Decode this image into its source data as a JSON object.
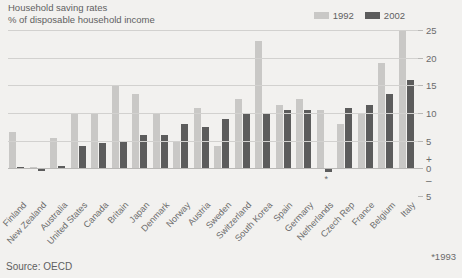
{
  "header": {
    "title": "Household saving rates",
    "subtitle": "% of disposable household income"
  },
  "legend": [
    {
      "label": "1992",
      "color": "#c9c8c6"
    },
    {
      "label": "2002",
      "color": "#5c5c5c"
    }
  ],
  "source": "Source: OECD",
  "footnote": "*1993",
  "asterisk_marker": "*",
  "colors": {
    "background": "#f2f1ef",
    "series_1992": "#c9c8c6",
    "series_2002": "#5c5c5c",
    "gridline": "#d2d1cf",
    "text": "#6b6b6b"
  },
  "axis": {
    "ticks": [
      25,
      20,
      15,
      10,
      5,
      0,
      5
    ],
    "plus_sign": "+",
    "minus_sign": "–",
    "min": -5,
    "max": 25
  },
  "chart_data": {
    "type": "bar",
    "title": "Household saving rates",
    "subtitle": "% of disposable household income",
    "xlabel": "",
    "ylabel": "% of disposable household income",
    "ylim": [
      -5,
      25
    ],
    "yticks": [
      -5,
      0,
      5,
      10,
      15,
      20,
      25
    ],
    "grid": true,
    "legend_position": "top-right",
    "categories": [
      "Finland",
      "New Zealand",
      "Australia",
      "United States",
      "Canada",
      "Britain",
      "Japan",
      "Denmark",
      "Norway",
      "Austria",
      "Sweden",
      "Switzerland",
      "South Korea",
      "Spain",
      "Germany",
      "Netherlands",
      "Czech Rep",
      "France",
      "Belgium",
      "Italy"
    ],
    "series": [
      {
        "name": "1992",
        "color": "#c9c8c6",
        "values": [
          6.5,
          0.2,
          5.5,
          10.0,
          10.0,
          15.0,
          13.5,
          10.0,
          5.0,
          11.0,
          4.0,
          12.5,
          23.0,
          11.5,
          12.5,
          10.5,
          8.0,
          10.0,
          19.0,
          25.0
        ]
      },
      {
        "name": "2002",
        "color": "#5c5c5c",
        "values": [
          0.3,
          -0.5,
          0.4,
          4.0,
          4.5,
          5.0,
          6.0,
          6.0,
          8.0,
          7.5,
          9.0,
          10.0,
          10.0,
          10.5,
          10.5,
          -0.7,
          11.0,
          11.5,
          13.5,
          16.0
        ]
      }
    ],
    "annotations": [
      {
        "text": "*",
        "category": "Netherlands",
        "series": "2002",
        "note": "*1993"
      }
    ]
  }
}
